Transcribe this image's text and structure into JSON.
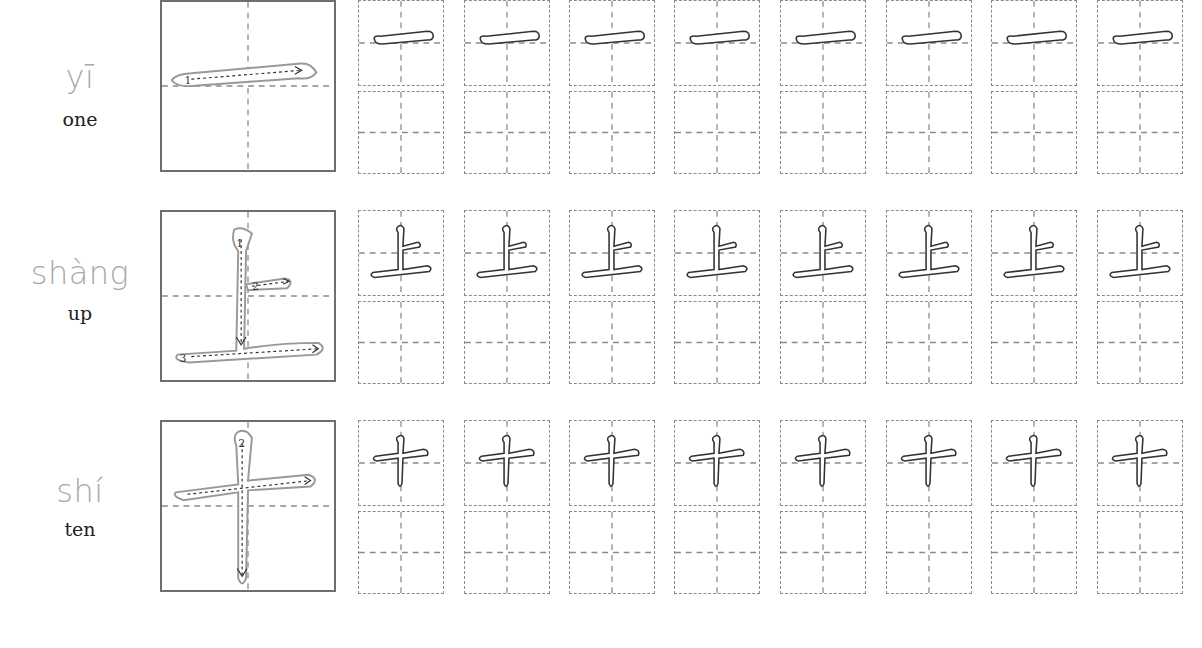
{
  "worksheet": {
    "rows": [
      {
        "character": "一",
        "pinyin": "yī",
        "english": "one",
        "stroke_count": 1,
        "stroke_numbers": [
          "1"
        ]
      },
      {
        "character": "上",
        "pinyin": "shàng",
        "english": "up",
        "stroke_count": 3,
        "stroke_numbers": [
          "1",
          "2",
          "3"
        ]
      },
      {
        "character": "十",
        "pinyin": "shí",
        "english": "ten",
        "stroke_count": 2,
        "stroke_numbers": [
          "1",
          "2"
        ]
      }
    ],
    "trace_boxes_per_row": 8,
    "blank_boxes_per_row": 8
  },
  "colors": {
    "pinyin": "#a8a8a8",
    "english": "#222222",
    "grid_border": "#8a8a8a",
    "guide_line": "#8a8a8a",
    "stroke_outline": "#333333"
  }
}
